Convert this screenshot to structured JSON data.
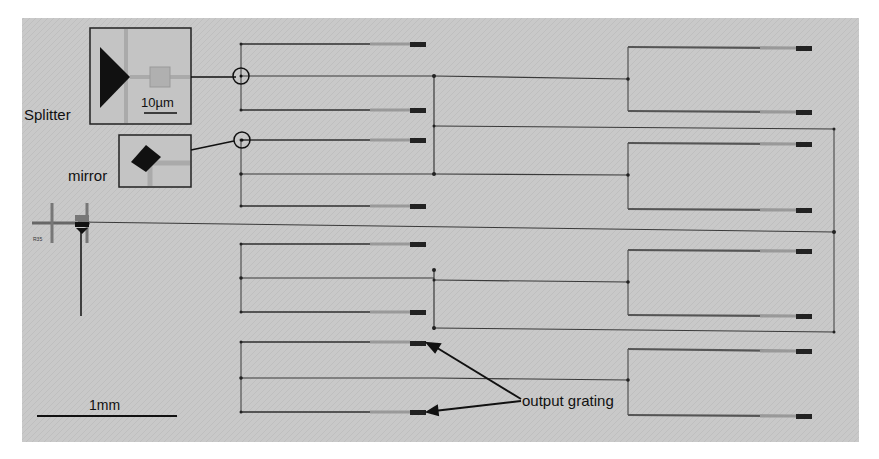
{
  "figure": {
    "background": "#ffffff",
    "panel_color": "#c9c9c9",
    "line_color": "#3a3a3a",
    "waveguide_color": "#8f8f8f",
    "grating_color": "#222222"
  },
  "labels": {
    "splitter": "Splitter",
    "mirror": "mirror",
    "scale_inset": "10µm",
    "scale_main": "1mm",
    "output_grating": "output grating",
    "input_tag": "R35"
  },
  "insets": [
    {
      "name": "splitter-inset",
      "shape": "triangle-splitter",
      "scale": "10µm"
    },
    {
      "name": "mirror-inset",
      "shape": "diamond-mirror"
    }
  ],
  "grating_rows_left_column": 8,
  "grating_rows_right_column": 8,
  "annotations": [
    {
      "text": "output grating",
      "arrows_to": [
        "grating-row-top",
        "grating-row-bottom"
      ]
    }
  ]
}
